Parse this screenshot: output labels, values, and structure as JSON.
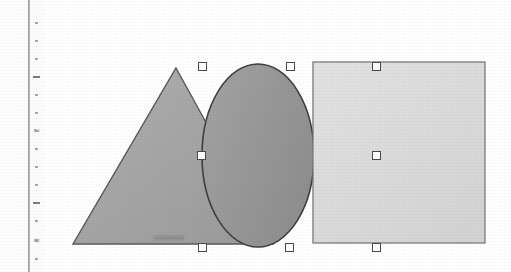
{
  "app": {
    "title": "Drawing Canvas",
    "background_color": "#ffffff"
  },
  "ruler": {
    "name": "vertical-ruler",
    "orientation": "vertical",
    "unit_labels": [
      "2",
      "3"
    ],
    "label_positions_px": [
      130,
      240
    ],
    "tick_positions_px": [
      22,
      40,
      58,
      76,
      94,
      112,
      130,
      148,
      166,
      184,
      202,
      220,
      240,
      258
    ],
    "major_tick_positions_px": [
      76,
      202
    ],
    "tick_color": "#a8a8a8",
    "line_color": "#8a8a8a"
  },
  "canvas": {
    "name": "drawing-canvas",
    "shapes": [
      {
        "id": "triangle",
        "name": "triangle-shape",
        "type": "triangle",
        "fill": "#a6a6a6",
        "stroke": "#555555",
        "selected": false,
        "bounds": {
          "x": 73,
          "y": 68,
          "width": 205,
          "height": 176
        }
      },
      {
        "id": "ellipse",
        "name": "ellipse-shape",
        "type": "ellipse",
        "fill": "#9a9a9a",
        "stroke": "#404040",
        "selected": true,
        "bounds": {
          "x": 202,
          "y": 64,
          "width": 112,
          "height": 183
        }
      },
      {
        "id": "rectangle",
        "name": "rectangle-shape",
        "type": "rectangle",
        "fill": "#dcdcdc",
        "stroke": "#7a7a7a",
        "selected": true,
        "bounds": {
          "x": 313,
          "y": 62,
          "width": 171,
          "height": 181
        }
      }
    ],
    "selection_handles": [
      {
        "name": "handle-top-left",
        "x": 202,
        "y": 66
      },
      {
        "name": "handle-top-middle",
        "x": 290,
        "y": 66
      },
      {
        "name": "handle-top-right",
        "x": 376,
        "y": 66
      },
      {
        "name": "handle-middle-left",
        "x": 201,
        "y": 155
      },
      {
        "name": "handle-middle-right",
        "x": 376,
        "y": 155
      },
      {
        "name": "handle-bottom-left",
        "x": 202,
        "y": 247
      },
      {
        "name": "handle-bottom-middle",
        "x": 289,
        "y": 247
      },
      {
        "name": "handle-bottom-right",
        "x": 376,
        "y": 247
      }
    ],
    "handle_style": {
      "fill": "#ffffff",
      "border": "#4a4a4a",
      "size_px": 9
    }
  }
}
